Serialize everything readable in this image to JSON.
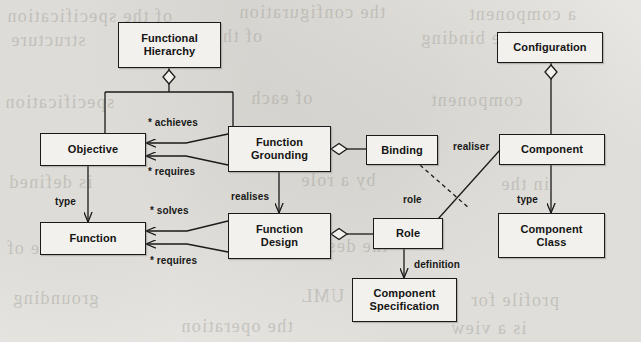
{
  "diagram": {
    "type": "uml-class-diagram",
    "colors": {
      "page_background": "#ecebe7",
      "box_fill": "#f2f1ed",
      "line": "#1a1a1a",
      "bleed_text": "#6d6a62"
    },
    "nodes": [
      {
        "id": "functional-hierarchy",
        "label": "Functional\nHierarchy",
        "x": 118,
        "y": 22,
        "w": 103,
        "h": 46
      },
      {
        "id": "objective",
        "label": "Objective",
        "x": 40,
        "y": 133,
        "w": 106,
        "h": 33
      },
      {
        "id": "function",
        "label": "Function",
        "x": 40,
        "y": 222,
        "w": 106,
        "h": 33
      },
      {
        "id": "function-grounding",
        "label": "Function\nGrounding",
        "x": 228,
        "y": 126,
        "w": 103,
        "h": 46
      },
      {
        "id": "function-design",
        "label": "Function\nDesign",
        "x": 228,
        "y": 213,
        "w": 103,
        "h": 46
      },
      {
        "id": "binding",
        "label": "Binding",
        "x": 366,
        "y": 135,
        "w": 72,
        "h": 30
      },
      {
        "id": "role",
        "label": "Role",
        "x": 373,
        "y": 218,
        "w": 70,
        "h": 31
      },
      {
        "id": "component-specification",
        "label": "Component\nSpecification",
        "x": 352,
        "y": 278,
        "w": 105,
        "h": 44
      },
      {
        "id": "configuration",
        "label": "Configuration",
        "x": 497,
        "y": 32,
        "w": 106,
        "h": 31
      },
      {
        "id": "component",
        "label": "Component",
        "x": 499,
        "y": 134,
        "w": 106,
        "h": 31
      },
      {
        "id": "component-class",
        "label": "Component\nClass",
        "x": 498,
        "y": 213,
        "w": 107,
        "h": 45
      }
    ],
    "edge_labels": [
      {
        "id": "achieves",
        "text": "* achieves",
        "x": 148,
        "y": 117
      },
      {
        "id": "requires-1",
        "text": "* requires",
        "x": 148,
        "y": 166
      },
      {
        "id": "type-left",
        "text": "type",
        "x": 55,
        "y": 196
      },
      {
        "id": "realises",
        "text": "realises",
        "x": 231,
        "y": 191
      },
      {
        "id": "solves",
        "text": "* solves",
        "x": 150,
        "y": 205
      },
      {
        "id": "requires-2",
        "text": "* requires",
        "x": 150,
        "y": 255
      },
      {
        "id": "realiser",
        "text": "realiser",
        "x": 453,
        "y": 141
      },
      {
        "id": "role-label",
        "text": "role",
        "x": 403,
        "y": 194
      },
      {
        "id": "definition",
        "text": "definition",
        "x": 414,
        "y": 259
      },
      {
        "id": "type-right",
        "text": "type",
        "x": 517,
        "y": 194
      }
    ],
    "relationships": [
      {
        "from": "functional-hierarchy",
        "to": "objective",
        "kind": "aggregation",
        "label": ""
      },
      {
        "from": "functional-hierarchy",
        "to": "function-grounding",
        "kind": "aggregation",
        "label": ""
      },
      {
        "from": "function-grounding",
        "to": "objective",
        "kind": "association",
        "label": "* achieves"
      },
      {
        "from": "function-grounding",
        "to": "objective",
        "kind": "association",
        "label": "* requires"
      },
      {
        "from": "objective",
        "to": "function",
        "kind": "association",
        "label": "type"
      },
      {
        "from": "function-grounding",
        "to": "function-design",
        "kind": "association",
        "label": "realises"
      },
      {
        "from": "function-design",
        "to": "function",
        "kind": "association",
        "label": "* solves"
      },
      {
        "from": "function-design",
        "to": "function",
        "kind": "association",
        "label": "* requires"
      },
      {
        "from": "function-grounding",
        "to": "binding",
        "kind": "aggregation",
        "label": ""
      },
      {
        "from": "function-design",
        "to": "role",
        "kind": "aggregation",
        "label": "role"
      },
      {
        "from": "binding",
        "to": "role",
        "kind": "dependency",
        "label": ""
      },
      {
        "from": "component",
        "to": "role",
        "kind": "association",
        "label": "realiser"
      },
      {
        "from": "role",
        "to": "component-specification",
        "kind": "association",
        "label": "definition"
      },
      {
        "from": "configuration",
        "to": "component",
        "kind": "aggregation",
        "label": ""
      },
      {
        "from": "component",
        "to": "component-class",
        "kind": "association",
        "label": "type"
      }
    ],
    "bleed_text_lines": [
      {
        "text": "of the specification",
        "x": 6,
        "y": 6,
        "size": 18
      },
      {
        "text": "the configuration",
        "x": 238,
        "y": 2,
        "size": 18
      },
      {
        "text": "a component",
        "x": 468,
        "y": 4,
        "size": 18
      },
      {
        "text": "structure",
        "x": 10,
        "y": 30,
        "size": 18
      },
      {
        "text": "of the role in",
        "x": 150,
        "y": 26,
        "size": 18
      },
      {
        "text": "the binding",
        "x": 420,
        "y": 28,
        "size": 18
      },
      {
        "text": "specification",
        "x": 4,
        "y": 92,
        "size": 18
      },
      {
        "text": "of each",
        "x": 250,
        "y": 88,
        "size": 18
      },
      {
        "text": "component",
        "x": 430,
        "y": 90,
        "size": 18
      },
      {
        "text": "is defined",
        "x": 8,
        "y": 172,
        "size": 18
      },
      {
        "text": "by a role",
        "x": 300,
        "y": 170,
        "size": 18
      },
      {
        "text": "in the",
        "x": 500,
        "y": 174,
        "size": 18
      },
      {
        "text": "structure of",
        "x": 6,
        "y": 238,
        "size": 18
      },
      {
        "text": "the design",
        "x": 300,
        "y": 236,
        "size": 18
      },
      {
        "text": "model",
        "x": 510,
        "y": 240,
        "size": 18
      },
      {
        "text": "grounding",
        "x": 12,
        "y": 288,
        "size": 18
      },
      {
        "text": "the UML",
        "x": 300,
        "y": 286,
        "size": 18
      },
      {
        "text": "profile for",
        "x": 470,
        "y": 290,
        "size": 18
      },
      {
        "text": "the operation",
        "x": 180,
        "y": 316,
        "size": 18
      },
      {
        "text": "is a view",
        "x": 450,
        "y": 318,
        "size": 18
      }
    ]
  }
}
